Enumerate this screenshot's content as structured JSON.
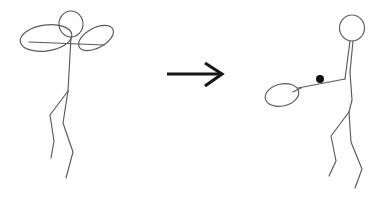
{
  "scene": {
    "title": "Stick figure transformation sketch",
    "background_color": "#fefefe",
    "width": 384,
    "height": 197,
    "ink_color": "#5a5a60",
    "arrow_color": "#16161a",
    "ball_color": "#101014",
    "caption": ""
  },
  "left_figure": {
    "label": "stick figure with raised oval arms",
    "head": {
      "cx": 71,
      "cy": 24,
      "rx": 12,
      "ry": 13
    },
    "torso": {
      "x1": 71,
      "y1": 37,
      "x2": 68,
      "y2": 91
    },
    "shoulder_line": {
      "x1": 29,
      "y1": 42,
      "x2": 104,
      "y2": 45
    },
    "left_oval": {
      "cx": 46,
      "cy": 38,
      "rx": 26,
      "ry": 13,
      "rotation": -8
    },
    "right_oval": {
      "cx": 96,
      "cy": 38,
      "rx": 19,
      "ry": 10,
      "rotation": -28
    },
    "back_leg": "M68,91 L50,115 L54,141 L51,158",
    "front_leg": "M68,91 L63,123 L73,152 L66,178",
    "hip_point": {
      "x": 68,
      "y": 91
    }
  },
  "arrow": {
    "label": "transformation arrow pointing right",
    "direction": "right",
    "shaft": {
      "x1": 167,
      "y1": 74,
      "x2": 219,
      "y2": 74
    },
    "head_path": "M205,63 L222,74 L205,86"
  },
  "right_figure": {
    "label": "stick figure holding a racket with ball",
    "head": {
      "cx": 352,
      "cy": 28,
      "rx": 12.5,
      "ry": 13
    },
    "neck_left": {
      "x1": 350,
      "y1": 41,
      "x2": 345,
      "y2": 79
    },
    "neck_right": {
      "x1": 353,
      "y1": 41,
      "x2": 350,
      "y2": 72
    },
    "torso": "M350,72 L352,100 L349,112",
    "arm": {
      "x1": 345,
      "y1": 79,
      "x2": 298,
      "y2": 88
    },
    "racket_handle": {
      "x1": 301,
      "y1": 88,
      "x2": 293,
      "y2": 92
    },
    "racket_head": {
      "cx": 282,
      "cy": 95,
      "rx": 17,
      "ry": 11,
      "rotation": -13
    },
    "ball": {
      "cx": 320,
      "cy": 79,
      "r": 4
    },
    "back_leg": "M349,112 L331,136 L336,161 L329,176",
    "front_leg": "M349,112 L351,142 L362,169 L355,188",
    "hip_point": {
      "x": 349,
      "y": 112
    }
  },
  "icons": {
    "arrow_right": "arrow-right-icon",
    "ball": "ball-dot-icon",
    "racket": "racket-icon"
  }
}
